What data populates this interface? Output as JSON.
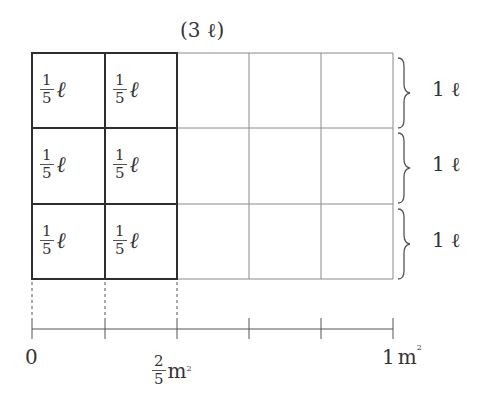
{
  "diagram": {
    "title": "(3 ℓ)",
    "grid": {
      "columns": 5,
      "rows": 3,
      "shaded_columns": 2
    },
    "cell_label": {
      "numerator": "1",
      "denominator": "5",
      "unit": "ℓ"
    },
    "row_labels": [
      "1 ℓ",
      "1 ℓ",
      "1 ℓ"
    ],
    "axis": {
      "start_label": "0",
      "fraction_label": {
        "numerator": "2",
        "denominator": "5",
        "unit": "m",
        "superscript": "2"
      },
      "end_label": {
        "value": "1",
        "unit": "m",
        "superscript": "2"
      },
      "ticks": 6
    },
    "colors": {
      "bold_line": "#333333",
      "thin_line": "#888888",
      "text": "#333333"
    }
  }
}
